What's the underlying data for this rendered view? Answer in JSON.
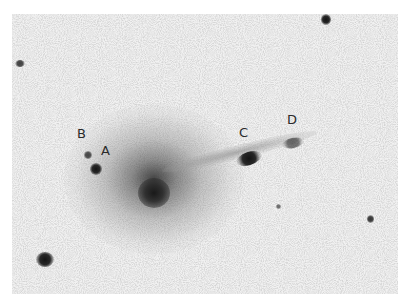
{
  "image": {
    "description": "Grayscale negative astronomical photograph of a galaxy with a faint tail and labeled companion objects",
    "colors": {
      "background": "#ffffff",
      "field": "#f1f1f1",
      "objects": "#1a1a1a",
      "label": "#2a2a2a"
    }
  },
  "labels": {
    "a": "A",
    "b": "B",
    "c": "C",
    "d": "D"
  }
}
